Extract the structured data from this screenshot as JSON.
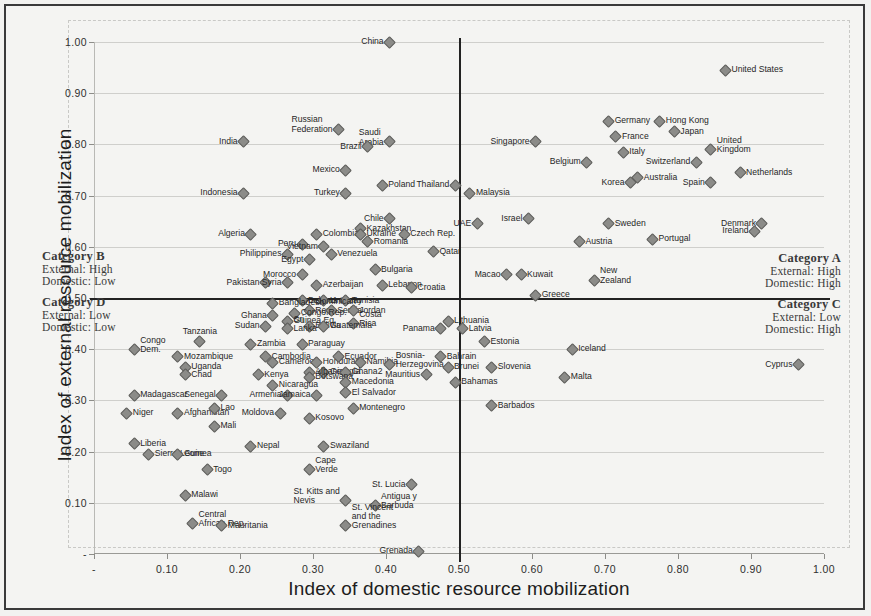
{
  "figure": {
    "xlabel": "Index of domestic resource mobilization",
    "ylabel": "Index of external resource mobilization"
  },
  "categories": [
    {
      "id": "A",
      "title": "Category A",
      "line1": "External: High",
      "line2": "Domestic: High"
    },
    {
      "id": "B",
      "title": "Category B",
      "line1": "External: High",
      "line2": "Domestic: Low"
    },
    {
      "id": "C",
      "title": "Category C",
      "line1": "External: Low",
      "line2": "Domestic: High"
    },
    {
      "id": "D",
      "title": "Category D",
      "line1": "External: Low",
      "line2": "Domestic: Low"
    }
  ],
  "chart_data": {
    "type": "scatter",
    "title": "",
    "xlabel": "Index of domestic resource mobilization",
    "ylabel": "Index of external resource mobilization",
    "xlim": [
      0,
      1.0
    ],
    "ylim": [
      0,
      1.0
    ],
    "xticks": [
      "-",
      "0.10",
      "0.20",
      "0.30",
      "0.40",
      "0.50",
      "0.60",
      "0.70",
      "0.80",
      "0.90",
      "1.00"
    ],
    "yticks": [
      "-",
      "0.10",
      "0.20",
      "0.30",
      "0.40",
      "0.50",
      "0.60",
      "0.70",
      "0.80",
      "0.90",
      "1.00"
    ],
    "grid": true,
    "legend": "none",
    "quadrant_lines": {
      "x": 0.5,
      "y": 0.5
    },
    "points": [
      {
        "label": "China",
        "x": 0.405,
        "y": 1.0,
        "lp": "r"
      },
      {
        "label": "United States",
        "x": 0.865,
        "y": 0.945,
        "lp": "l"
      },
      {
        "label": "Russian\nFederation",
        "x": 0.335,
        "y": 0.83,
        "lp": "r"
      },
      {
        "label": "Saudi\nArabia",
        "x": 0.405,
        "y": 0.805,
        "lp": "r"
      },
      {
        "label": "Brazil",
        "x": 0.375,
        "y": 0.795,
        "lp": "r"
      },
      {
        "label": "India",
        "x": 0.205,
        "y": 0.805,
        "lp": "r"
      },
      {
        "label": "Germany",
        "x": 0.705,
        "y": 0.845,
        "lp": "l"
      },
      {
        "label": "Hong Kong",
        "x": 0.775,
        "y": 0.845,
        "lp": "l"
      },
      {
        "label": "Japan",
        "x": 0.795,
        "y": 0.825,
        "lp": "l"
      },
      {
        "label": "France",
        "x": 0.715,
        "y": 0.815,
        "lp": "l"
      },
      {
        "label": "Singapore",
        "x": 0.605,
        "y": 0.805,
        "lp": "r"
      },
      {
        "label": "United\nKingdom",
        "x": 0.845,
        "y": 0.79,
        "lp": "l"
      },
      {
        "label": "Italy",
        "x": 0.725,
        "y": 0.785,
        "lp": "l"
      },
      {
        "label": "Switzerland",
        "x": 0.825,
        "y": 0.765,
        "lp": "r"
      },
      {
        "label": "Belgium",
        "x": 0.675,
        "y": 0.765,
        "lp": "r"
      },
      {
        "label": "Mexico",
        "x": 0.345,
        "y": 0.75,
        "lp": "r"
      },
      {
        "label": "Netherlands",
        "x": 0.885,
        "y": 0.745,
        "lp": "l"
      },
      {
        "label": "Australia",
        "x": 0.745,
        "y": 0.735,
        "lp": "l"
      },
      {
        "label": "Korea",
        "x": 0.735,
        "y": 0.725,
        "lp": "r"
      },
      {
        "label": "Spain",
        "x": 0.845,
        "y": 0.725,
        "lp": "r"
      },
      {
        "label": "Poland",
        "x": 0.395,
        "y": 0.72,
        "lp": "l"
      },
      {
        "label": "Thailand",
        "x": 0.495,
        "y": 0.72,
        "lp": "r"
      },
      {
        "label": "Turkey",
        "x": 0.345,
        "y": 0.705,
        "lp": "r"
      },
      {
        "label": "Indonesia",
        "x": 0.205,
        "y": 0.705,
        "lp": "r"
      },
      {
        "label": "Malaysia",
        "x": 0.515,
        "y": 0.705,
        "lp": "l"
      },
      {
        "label": "Denmark",
        "x": 0.915,
        "y": 0.645,
        "lp": "r"
      },
      {
        "label": "Israel",
        "x": 0.595,
        "y": 0.655,
        "lp": "r"
      },
      {
        "label": "Chile",
        "x": 0.405,
        "y": 0.655,
        "lp": "r"
      },
      {
        "label": "Sweden",
        "x": 0.705,
        "y": 0.645,
        "lp": "l"
      },
      {
        "label": "Kazakhstan",
        "x": 0.365,
        "y": 0.635,
        "lp": "l"
      },
      {
        "label": "UAE",
        "x": 0.525,
        "y": 0.645,
        "lp": "r"
      },
      {
        "label": "Ireland",
        "x": 0.905,
        "y": 0.63,
        "lp": "r"
      },
      {
        "label": "Colombia",
        "x": 0.305,
        "y": 0.625,
        "lp": "l"
      },
      {
        "label": "Ukraine",
        "x": 0.365,
        "y": 0.625,
        "lp": "l"
      },
      {
        "label": "Czech Rep.",
        "x": 0.425,
        "y": 0.625,
        "lp": "l"
      },
      {
        "label": "Algeria",
        "x": 0.215,
        "y": 0.625,
        "lp": "r"
      },
      {
        "label": "Portugal",
        "x": 0.765,
        "y": 0.615,
        "lp": "l"
      },
      {
        "label": "Austria",
        "x": 0.665,
        "y": 0.61,
        "lp": "l"
      },
      {
        "label": "Romania",
        "x": 0.375,
        "y": 0.61,
        "lp": "l"
      },
      {
        "label": "Peru",
        "x": 0.285,
        "y": 0.605,
        "lp": "r"
      },
      {
        "label": "Vietnam",
        "x": 0.315,
        "y": 0.6,
        "lp": "r"
      },
      {
        "label": "Philippines",
        "x": 0.265,
        "y": 0.585,
        "lp": "r"
      },
      {
        "label": "Venezuela",
        "x": 0.325,
        "y": 0.585,
        "lp": "l"
      },
      {
        "label": "Egypt",
        "x": 0.295,
        "y": 0.575,
        "lp": "r"
      },
      {
        "label": "Qatar",
        "x": 0.465,
        "y": 0.59,
        "lp": "l"
      },
      {
        "label": "Bulgaria",
        "x": 0.385,
        "y": 0.555,
        "lp": "l"
      },
      {
        "label": "Morocco",
        "x": 0.285,
        "y": 0.545,
        "lp": "r"
      },
      {
        "label": "Macao",
        "x": 0.565,
        "y": 0.545,
        "lp": "r"
      },
      {
        "label": "Kuwait",
        "x": 0.585,
        "y": 0.545,
        "lp": "l"
      },
      {
        "label": "New\nZealand",
        "x": 0.685,
        "y": 0.535,
        "lp": "l"
      },
      {
        "label": "Pakistan",
        "x": 0.235,
        "y": 0.53,
        "lp": "r"
      },
      {
        "label": "Syria",
        "x": 0.265,
        "y": 0.53,
        "lp": "r"
      },
      {
        "label": "Azerbaijan",
        "x": 0.305,
        "y": 0.525,
        "lp": "l"
      },
      {
        "label": "Lebanon",
        "x": 0.395,
        "y": 0.525,
        "lp": "l"
      },
      {
        "label": "Croatia",
        "x": 0.435,
        "y": 0.52,
        "lp": "l"
      },
      {
        "label": "Greece",
        "x": 0.605,
        "y": 0.505,
        "lp": "l"
      },
      {
        "label": "Belarus",
        "x": 0.285,
        "y": 0.495,
        "lp": "l"
      },
      {
        "label": "Uruguay",
        "x": 0.315,
        "y": 0.495,
        "lp": "l"
      },
      {
        "label": "Tunisia",
        "x": 0.345,
        "y": 0.495,
        "lp": "l"
      },
      {
        "label": "Bangladesh",
        "x": 0.245,
        "y": 0.49,
        "lp": "l"
      },
      {
        "label": "Dominican\nRep.",
        "x": 0.295,
        "y": 0.475,
        "lp": "l"
      },
      {
        "label": "Serbia",
        "x": 0.325,
        "y": 0.475,
        "lp": "l"
      },
      {
        "label": "Jordan",
        "x": 0.355,
        "y": 0.475,
        "lp": "l"
      },
      {
        "label": "Congo Rep.",
        "x": 0.275,
        "y": 0.47,
        "lp": "l"
      },
      {
        "label": "Ghana",
        "x": 0.245,
        "y": 0.465,
        "lp": "r"
      },
      {
        "label": "Guinea Eq.",
        "x": 0.265,
        "y": 0.455,
        "lp": "l"
      },
      {
        "label": "Costa\nRica",
        "x": 0.355,
        "y": 0.45,
        "lp": "l"
      },
      {
        "label": "Lithuania",
        "x": 0.485,
        "y": 0.455,
        "lp": "l"
      },
      {
        "label": "Sudan",
        "x": 0.235,
        "y": 0.445,
        "lp": "r"
      },
      {
        "label": "Bolivia",
        "x": 0.295,
        "y": 0.445,
        "lp": "l"
      },
      {
        "label": "Guatemala",
        "x": 0.315,
        "y": 0.445,
        "lp": "l"
      },
      {
        "label": "Sri\nLanka",
        "x": 0.265,
        "y": 0.44,
        "lp": "l"
      },
      {
        "label": "Panama",
        "x": 0.475,
        "y": 0.44,
        "lp": "r"
      },
      {
        "label": "Latvia",
        "x": 0.505,
        "y": 0.44,
        "lp": "l"
      },
      {
        "label": "Congo\nDem.",
        "x": 0.055,
        "y": 0.4,
        "lp": "l"
      },
      {
        "label": "Tanzania",
        "x": 0.145,
        "y": 0.415,
        "lp": "c"
      },
      {
        "label": "Zambia",
        "x": 0.215,
        "y": 0.41,
        "lp": "l"
      },
      {
        "label": "Paraguay",
        "x": 0.285,
        "y": 0.41,
        "lp": "l"
      },
      {
        "label": "Estonia",
        "x": 0.535,
        "y": 0.415,
        "lp": "l"
      },
      {
        "label": "Iceland",
        "x": 0.655,
        "y": 0.4,
        "lp": "l"
      },
      {
        "label": "Mozambique",
        "x": 0.115,
        "y": 0.385,
        "lp": "l"
      },
      {
        "label": "Cambodia",
        "x": 0.235,
        "y": 0.385,
        "lp": "l"
      },
      {
        "label": "Cameroon",
        "x": 0.245,
        "y": 0.375,
        "lp": "l"
      },
      {
        "label": "Honduras",
        "x": 0.305,
        "y": 0.375,
        "lp": "l"
      },
      {
        "label": "Ecuador",
        "x": 0.335,
        "y": 0.385,
        "lp": "l"
      },
      {
        "label": "Namibia",
        "x": 0.365,
        "y": 0.375,
        "lp": "l"
      },
      {
        "label": "Bosnia-\nHerzegovina",
        "x": 0.405,
        "y": 0.37,
        "lp": "l"
      },
      {
        "label": "Bahrain",
        "x": 0.475,
        "y": 0.385,
        "lp": "l"
      },
      {
        "label": "Brunei",
        "x": 0.485,
        "y": 0.365,
        "lp": "l"
      },
      {
        "label": "Slovenia",
        "x": 0.545,
        "y": 0.365,
        "lp": "l"
      },
      {
        "label": "Uganda",
        "x": 0.125,
        "y": 0.365,
        "lp": "l"
      },
      {
        "label": "Georgia",
        "x": 0.315,
        "y": 0.355,
        "lp": "l"
      },
      {
        "label": "Albania",
        "x": 0.295,
        "y": 0.355,
        "lp": "l"
      },
      {
        "label": "Ghana2",
        "x": 0.345,
        "y": 0.355,
        "lp": "l"
      },
      {
        "label": "Chad",
        "x": 0.125,
        "y": 0.35,
        "lp": "l"
      },
      {
        "label": "Kenya",
        "x": 0.225,
        "y": 0.35,
        "lp": "l"
      },
      {
        "label": "Botswana",
        "x": 0.295,
        "y": 0.345,
        "lp": "l"
      },
      {
        "label": "Mauritius",
        "x": 0.455,
        "y": 0.35,
        "lp": "r"
      },
      {
        "label": "Malta",
        "x": 0.645,
        "y": 0.345,
        "lp": "l"
      },
      {
        "label": "Cyprus",
        "x": 0.965,
        "y": 0.37,
        "lp": "r"
      },
      {
        "label": "Nicaragua",
        "x": 0.245,
        "y": 0.33,
        "lp": "l"
      },
      {
        "label": "Bahamas",
        "x": 0.495,
        "y": 0.335,
        "lp": "l"
      },
      {
        "label": "Macedonia",
        "x": 0.345,
        "y": 0.335,
        "lp": "l"
      },
      {
        "label": "El Salvador",
        "x": 0.345,
        "y": 0.315,
        "lp": "l"
      },
      {
        "label": "Madagascar",
        "x": 0.055,
        "y": 0.31,
        "lp": "l"
      },
      {
        "label": "Senegal",
        "x": 0.175,
        "y": 0.31,
        "lp": "r"
      },
      {
        "label": "Armenia",
        "x": 0.265,
        "y": 0.31,
        "lp": "r"
      },
      {
        "label": "Jamaica",
        "x": 0.305,
        "y": 0.31,
        "lp": "r"
      },
      {
        "label": "Barbados",
        "x": 0.545,
        "y": 0.29,
        "lp": "l"
      },
      {
        "label": "Niger",
        "x": 0.045,
        "y": 0.275,
        "lp": "l"
      },
      {
        "label": "Afghanistan",
        "x": 0.115,
        "y": 0.275,
        "lp": "l"
      },
      {
        "label": "Lao",
        "x": 0.165,
        "y": 0.285,
        "lp": "l"
      },
      {
        "label": "Moldova",
        "x": 0.255,
        "y": 0.275,
        "lp": "r"
      },
      {
        "label": "Kosovo",
        "x": 0.295,
        "y": 0.265,
        "lp": "l"
      },
      {
        "label": "Montenegro",
        "x": 0.355,
        "y": 0.285,
        "lp": "l"
      },
      {
        "label": "Mali",
        "x": 0.165,
        "y": 0.25,
        "lp": "l"
      },
      {
        "label": "Liberia",
        "x": 0.055,
        "y": 0.215,
        "lp": "l"
      },
      {
        "label": "Nepal",
        "x": 0.215,
        "y": 0.21,
        "lp": "l"
      },
      {
        "label": "Swaziland",
        "x": 0.315,
        "y": 0.21,
        "lp": "l"
      },
      {
        "label": "Sierra Leone",
        "x": 0.075,
        "y": 0.195,
        "lp": "l"
      },
      {
        "label": "Guinea",
        "x": 0.115,
        "y": 0.195,
        "lp": "l"
      },
      {
        "label": "Togo",
        "x": 0.155,
        "y": 0.165,
        "lp": "l"
      },
      {
        "label": "Cape\nVerde",
        "x": 0.295,
        "y": 0.165,
        "lp": "l"
      },
      {
        "label": "St. Lucia",
        "x": 0.435,
        "y": 0.135,
        "lp": "r"
      },
      {
        "label": "Malawi",
        "x": 0.125,
        "y": 0.115,
        "lp": "l"
      },
      {
        "label": "St. Kitts and\nNevis",
        "x": 0.345,
        "y": 0.105,
        "lp": "r"
      },
      {
        "label": "Antigua y\nBarbuda",
        "x": 0.385,
        "y": 0.095,
        "lp": "l"
      },
      {
        "label": "Central\nAfrican Rep.",
        "x": 0.135,
        "y": 0.06,
        "lp": "l"
      },
      {
        "label": "Mauritania",
        "x": 0.175,
        "y": 0.055,
        "lp": "l"
      },
      {
        "label": "St. Vincent\nand the\nGrenadines",
        "x": 0.345,
        "y": 0.055,
        "lp": "l"
      },
      {
        "label": "Grenada",
        "x": 0.445,
        "y": 0.005,
        "lp": "r"
      }
    ]
  }
}
